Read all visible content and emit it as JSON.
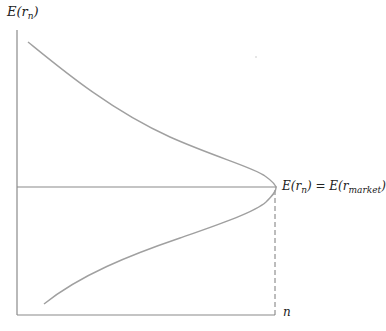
{
  "diagram": {
    "y_axis_label": {
      "main": "E(r",
      "sub": "n",
      "close": ")"
    },
    "x_axis_label": "n",
    "equilibrium_label": {
      "left_main": "E(r",
      "left_sub": "n",
      "left_close": ")",
      "equals": " = ",
      "right_main": "E(r",
      "right_sub": "market",
      "right_close": ")"
    },
    "colors": {
      "axis": "#8a8a8a",
      "curve": "#a0a0a0",
      "dashed": "#7a7a7a",
      "text": "#222222"
    }
  }
}
